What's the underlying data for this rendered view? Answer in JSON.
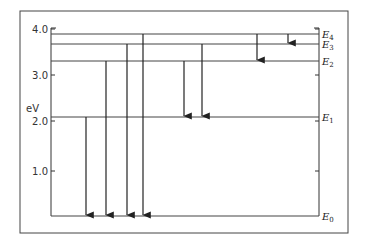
{
  "diagram": {
    "type": "energy-level-diagram",
    "y_axis": {
      "unit_label": "eV",
      "ticks": [
        {
          "value": 4.0,
          "label": "4.0",
          "y": 29
        },
        {
          "value": 3.0,
          "label": "3.0",
          "y": 75
        },
        {
          "value": 2.0,
          "label": "2.0",
          "y": 121
        },
        {
          "value": 1.0,
          "label": "1.0",
          "y": 171
        }
      ]
    },
    "levels": [
      {
        "name": "E",
        "sub": "0",
        "energy_eV": 0.0,
        "y": 216
      },
      {
        "name": "E",
        "sub": "1",
        "energy_eV": 2.1,
        "y": 117
      },
      {
        "name": "E",
        "sub": "2",
        "energy_eV": 3.3,
        "y": 61
      },
      {
        "name": "E",
        "sub": "3",
        "energy_eV": 3.65,
        "y": 44
      },
      {
        "name": "E",
        "sub": "4",
        "energy_eV": 3.85,
        "y": 34
      }
    ],
    "transitions": [
      {
        "from": "E1",
        "to": "E0",
        "x": 86
      },
      {
        "from": "E2",
        "to": "E0",
        "x": 106
      },
      {
        "from": "E3",
        "to": "E0",
        "x": 127
      },
      {
        "from": "E4",
        "to": "E0",
        "x": 143
      },
      {
        "from": "E2",
        "to": "E1",
        "x": 184
      },
      {
        "from": "E3",
        "to": "E1",
        "x": 202
      },
      {
        "from": "E4",
        "to": "E2",
        "x": 257
      },
      {
        "from": "E4",
        "to": "E3",
        "x": 288
      }
    ]
  }
}
